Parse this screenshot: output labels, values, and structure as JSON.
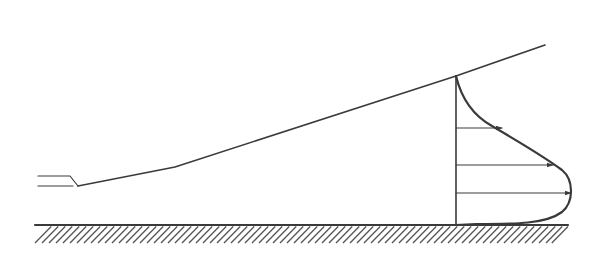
{
  "diagram": {
    "type": "wall-jet-velocity-profile",
    "colors": {
      "line": "#3a3a3a",
      "hatch": "#555555",
      "background": "#ffffff"
    },
    "nozzle": {
      "upper_line": {
        "x1": 38,
        "y1": 176,
        "x2": 70,
        "y2": 176
      },
      "lower_line": {
        "x1": 38,
        "y1": 186,
        "x2": 73,
        "y2": 186
      },
      "lip_to": {
        "x": 78,
        "y": 186
      }
    },
    "jet_boundary": {
      "points": [
        [
          78,
          186
        ],
        [
          175,
          167
        ],
        [
          456,
          76
        ],
        [
          545,
          45
        ]
      ]
    },
    "wall": {
      "x1": 35,
      "x2": 568,
      "y": 225,
      "hatch_depth": 18,
      "hatch_spacing": 7
    },
    "profile": {
      "origin_x": 456,
      "top_y": 76,
      "bottom_y": 225,
      "arrows": [
        {
          "y": 128,
          "tip_x": 502
        },
        {
          "y": 165,
          "tip_x": 553
        },
        {
          "y": 193,
          "tip_x": 571
        }
      ]
    }
  }
}
